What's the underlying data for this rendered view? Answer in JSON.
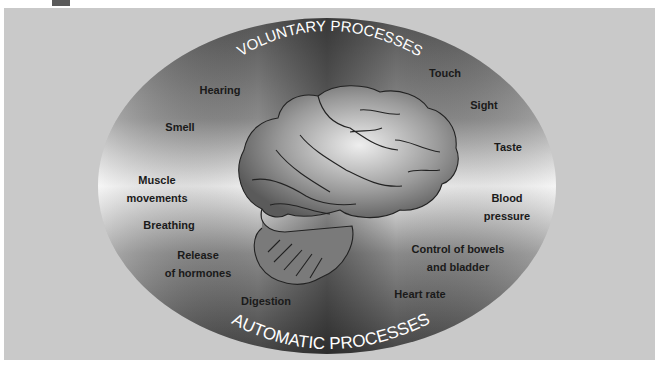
{
  "diagram": {
    "title_top": "VOLUNTARY PROCESSES",
    "title_bottom": "AUTOMATIC PROCESSES",
    "center_image": "brain-illustration",
    "colors": {
      "panel": "#c9c9c9",
      "ellipse_dark": "#4a4a4a",
      "ellipse_light": "#f0f0f0",
      "label_text": "#1a1a1a",
      "title_text": "#ffffff"
    },
    "left_labels": [
      {
        "id": "hearing",
        "text": "Hearing"
      },
      {
        "id": "smell",
        "text": "Smell"
      },
      {
        "id": "muscle",
        "line1": "Muscle",
        "line2": "movements"
      },
      {
        "id": "breathing",
        "text": "Breathing"
      },
      {
        "id": "hormones",
        "line1": "Release",
        "line2": "of hormones"
      },
      {
        "id": "digestion",
        "text": "Digestion"
      }
    ],
    "right_labels": [
      {
        "id": "touch",
        "text": "Touch"
      },
      {
        "id": "sight",
        "text": "Sight"
      },
      {
        "id": "taste",
        "text": "Taste"
      },
      {
        "id": "blood",
        "line1": "Blood",
        "line2": "pressure"
      },
      {
        "id": "bowels",
        "line1": "Control of bowels",
        "line2": "and bladder"
      },
      {
        "id": "heart",
        "text": "Heart rate"
      }
    ]
  }
}
